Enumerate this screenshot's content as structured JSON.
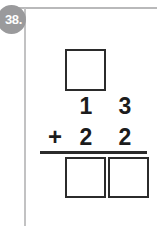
{
  "problem": {
    "number_label": "38.",
    "type": "vertical-addition",
    "operator": "+",
    "addend_top": {
      "tens": "1",
      "ones": "3"
    },
    "addend_bottom": {
      "tens": "2",
      "ones": "2"
    },
    "carry_box": {
      "value": "",
      "label": "carry box"
    },
    "answer_boxes": [
      {
        "place": "tens",
        "value": ""
      },
      {
        "place": "ones",
        "value": ""
      }
    ]
  },
  "colors": {
    "ink": "#1c1c1c",
    "box_border": "#2b2b2b",
    "badge_background": "#9a9a9c",
    "badge_text": "#ffffff",
    "rule": "#b9b9ba"
  }
}
